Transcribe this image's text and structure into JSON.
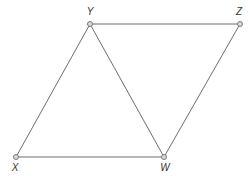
{
  "diagram": {
    "type": "geometry-figure",
    "points": [
      {
        "name": "Y",
        "x": 90,
        "y": 24,
        "label_x": 90,
        "label_y": 15
      },
      {
        "name": "Z",
        "x": 240,
        "y": 24,
        "label_x": 239,
        "label_y": 15
      },
      {
        "name": "X",
        "x": 16,
        "y": 157,
        "label_x": 15,
        "label_y": 171
      },
      {
        "name": "W",
        "x": 164,
        "y": 157,
        "label_x": 165,
        "label_y": 171
      }
    ],
    "segments": [
      {
        "from": "Y",
        "to": "Z"
      },
      {
        "from": "X",
        "to": "Y"
      },
      {
        "from": "Y",
        "to": "W"
      },
      {
        "from": "X",
        "to": "W"
      },
      {
        "from": "W",
        "to": "Z"
      }
    ],
    "colors": {
      "line": "#6e6e6e",
      "point_fill": "#d9d9d9",
      "point_stroke": "#7a7a7a",
      "label": "#333333"
    }
  }
}
